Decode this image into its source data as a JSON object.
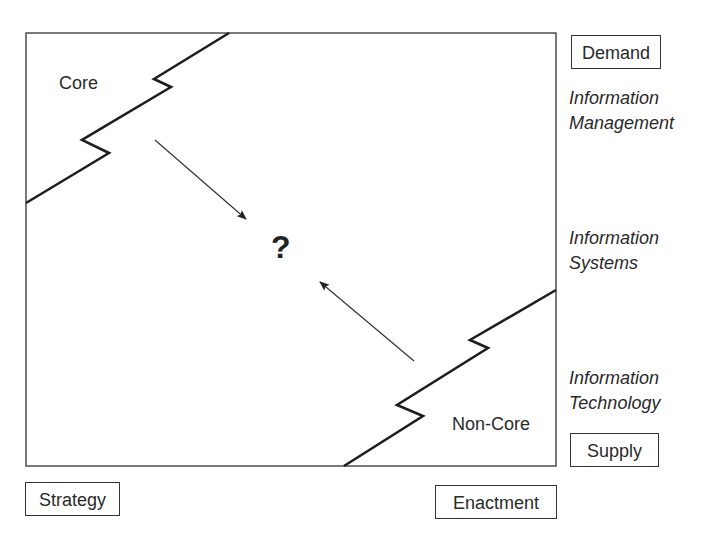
{
  "diagram": {
    "main_box": {
      "x": 26,
      "y": 33,
      "width": 530,
      "height": 433
    },
    "regions": {
      "core": {
        "label": "Core"
      },
      "non_core": {
        "label": "Non-Core"
      },
      "center": {
        "label": "?"
      }
    },
    "axes": {
      "vertical_top": "Demand",
      "vertical_bottom": "Supply",
      "horizontal_left": "Strategy",
      "horizontal_right": "Enactment"
    },
    "levels": [
      {
        "line1": "Information",
        "line2": "Management"
      },
      {
        "line1": "Information",
        "line2": "Systems"
      },
      {
        "line1": "Information",
        "line2": "Technology"
      }
    ],
    "colors": {
      "line": "#222222",
      "text": "#2a2a2a",
      "background": "#ffffff"
    }
  }
}
